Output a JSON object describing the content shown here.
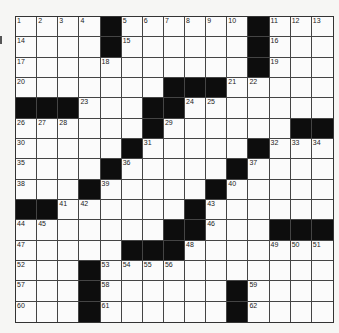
{
  "puzzle": {
    "rows": 15,
    "cols": 15,
    "layout": [
      "....#......#...",
      "....#......#...",
      "...........#...",
      ".......###.....",
      "###...##.......",
      "......#......##",
      ".....#.....#...",
      "....#.....#....",
      "...#.....#.....",
      "##......#......",
      "..*....##...###",
      ".....###.......",
      "...#...........",
      "...#......#....",
      "...#......#...."
    ],
    "numbers": {
      "0,0": "1",
      "0,1": "2",
      "0,2": "3",
      "0,3": "4",
      "0,5": "5",
      "0,6": "6",
      "0,7": "7",
      "0,8": "8",
      "0,9": "9",
      "0,10": "10",
      "0,12": "11",
      "0,13": "12",
      "0,14": "13",
      "1,0": "14",
      "1,5": "15",
      "1,12": "16",
      "2,0": "17",
      "2,4": "18",
      "2,12": "19",
      "3,0": "20",
      "3,10": "21",
      "3,11": "22",
      "4,3": "23",
      "4,8": "24",
      "4,9": "25",
      "5,0": "26",
      "5,1": "27",
      "5,2": "28",
      "5,7": "29",
      "6,0": "30",
      "6,6": "31",
      "6,12": "32",
      "6,13": "33",
      "6,14": "34",
      "7,0": "35",
      "7,5": "36",
      "7,11": "37",
      "8,0": "38",
      "8,4": "39",
      "8,10": "40",
      "9,2": "41",
      "9,3": "42",
      "9,9": "43",
      "10,0": "44",
      "10,1": "45",
      "10,9": "46",
      "11,0": "47",
      "11,8": "48",
      "11,12": "49",
      "11,13": "50",
      "11,14": "51",
      "12,0": "52",
      "12,4": "53",
      "12,5": "54",
      "12,6": "55",
      "12,7": "56",
      "13,0": "57",
      "13,4": "58",
      "13,11": "59",
      "14,0": "60",
      "14,4": "61",
      "14,11": "62"
    },
    "colors": {
      "black_square": "#0d0d0d",
      "white_square": "#fbfbfb",
      "grid_line": "#444444"
    }
  }
}
